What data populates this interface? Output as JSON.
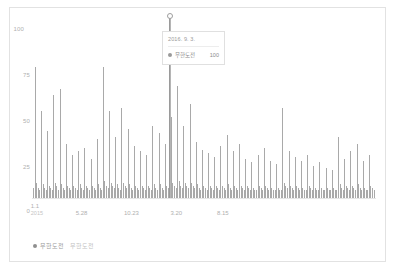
{
  "card": {
    "border_color": "#e2e2e2",
    "background": "#ffffff"
  },
  "tooltip": {
    "date": "2016. 9. 3.",
    "series_name": "무한도전",
    "value": "100",
    "marker_icon": "circle-marker"
  },
  "legend": {
    "primary_label": "무한도전",
    "secondary_label": "무한도전"
  },
  "chart_data": {
    "type": "bar",
    "title": "",
    "xlabel": "",
    "ylabel": "",
    "ylim": [
      0,
      100
    ],
    "yticks": [
      "100",
      "75",
      "50",
      "25",
      "0"
    ],
    "ytick_values": [
      100,
      75,
      50,
      25,
      0
    ],
    "grid": false,
    "legend_position": "bottom-left",
    "bar_color": "#a9a9a9",
    "highlight_color": "#9a9a9a",
    "highlight_index": 88,
    "highlight_label": "2016. 9. 3.",
    "highlight_value": 100,
    "xticks": [
      {
        "label": "1.1",
        "sub": "2015",
        "index": 0
      },
      {
        "label": "5.28",
        "sub": "",
        "index": 29
      },
      {
        "label": "10.23",
        "sub": "",
        "index": 60
      },
      {
        "label": "3.20",
        "sub": "",
        "index": 90
      },
      {
        "label": "8.15",
        "sub": "",
        "index": 120
      },
      {
        "label": "",
        "sub": "",
        "index": 150
      }
    ],
    "series": [
      {
        "name": "무한도전",
        "values": [
          6,
          72,
          9,
          6,
          5,
          48,
          8,
          6,
          5,
          37,
          7,
          6,
          5,
          57,
          9,
          7,
          5,
          60,
          8,
          6,
          5,
          30,
          7,
          6,
          5,
          24,
          7,
          6,
          5,
          26,
          8,
          6,
          5,
          28,
          7,
          6,
          5,
          22,
          7,
          6,
          5,
          33,
          8,
          6,
          5,
          72,
          10,
          7,
          6,
          48,
          9,
          7,
          6,
          34,
          8,
          6,
          5,
          50,
          9,
          7,
          6,
          38,
          8,
          6,
          5,
          29,
          7,
          6,
          5,
          26,
          7,
          6,
          5,
          24,
          7,
          6,
          5,
          40,
          8,
          6,
          5,
          36,
          8,
          6,
          5,
          30,
          7,
          6,
          100,
          45,
          9,
          7,
          6,
          62,
          10,
          7,
          6,
          40,
          9,
          7,
          6,
          52,
          9,
          7,
          6,
          31,
          8,
          6,
          5,
          27,
          7,
          6,
          5,
          25,
          7,
          6,
          5,
          23,
          7,
          6,
          5,
          29,
          7,
          6,
          5,
          35,
          8,
          6,
          5,
          26,
          7,
          6,
          5,
          30,
          7,
          6,
          5,
          22,
          7,
          6,
          5,
          20,
          6,
          5,
          5,
          24,
          7,
          6,
          5,
          28,
          7,
          6,
          5,
          21,
          6,
          5,
          5,
          19,
          6,
          5,
          5,
          50,
          9,
          7,
          6,
          26,
          7,
          6,
          5,
          23,
          7,
          6,
          5,
          21,
          6,
          5,
          5,
          24,
          7,
          6,
          5,
          18,
          6,
          5,
          5,
          20,
          6,
          5,
          5,
          17,
          6,
          5,
          5,
          16,
          6,
          5,
          5,
          34,
          8,
          6,
          5,
          22,
          7,
          6,
          5,
          26,
          7,
          6,
          5,
          30,
          8,
          6,
          5,
          21,
          6,
          5,
          5,
          24,
          7,
          6,
          5
        ]
      }
    ]
  }
}
